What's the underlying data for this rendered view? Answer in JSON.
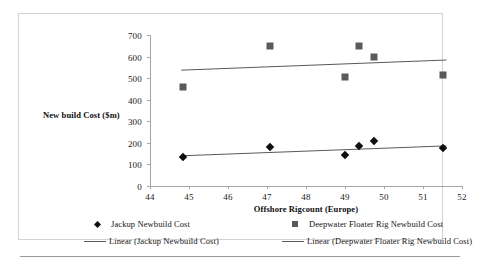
{
  "chart_data": {
    "type": "scatter",
    "title": "",
    "xlabel": "Offshore Rigcount (Europe)",
    "ylabel": "New build Cost ($m)",
    "xlim": [
      44,
      52
    ],
    "ylim": [
      0,
      700
    ],
    "xticks": [
      44,
      45,
      46,
      47,
      48,
      49,
      50,
      51,
      52
    ],
    "yticks": [
      0,
      100,
      200,
      300,
      400,
      500,
      600,
      700
    ],
    "grid": false,
    "legend_position": "bottom",
    "series": [
      {
        "name": "Jackup Newbuild Cost",
        "marker": "diamond",
        "color": "#0f0f0f",
        "points": [
          {
            "x": 44.85,
            "y": 133
          },
          {
            "x": 47.08,
            "y": 183
          },
          {
            "x": 49.0,
            "y": 143
          },
          {
            "x": 49.35,
            "y": 186
          },
          {
            "x": 49.75,
            "y": 207
          },
          {
            "x": 51.5,
            "y": 174
          }
        ]
      },
      {
        "name": "Deepwater Floater Rig Newbuild Cost",
        "marker": "square",
        "color": "#5a5a5a",
        "points": [
          {
            "x": 44.85,
            "y": 458
          },
          {
            "x": 47.08,
            "y": 648
          },
          {
            "x": 49.0,
            "y": 506
          },
          {
            "x": 49.35,
            "y": 647
          },
          {
            "x": 49.75,
            "y": 598
          },
          {
            "x": 51.5,
            "y": 514
          }
        ]
      }
    ],
    "trendlines": [
      {
        "name": "Linear (Jackup Newbuild Cost)",
        "color": "#595959",
        "x0": 44.8,
        "y0": 140,
        "x1": 51.6,
        "y1": 186
      },
      {
        "name": "Linear (Deepwater Floater Rig Newbuild Cost)",
        "color": "#595959",
        "x0": 44.8,
        "y0": 537,
        "x1": 51.6,
        "y1": 584
      }
    ]
  },
  "axis": {
    "y_title": "New build Cost ($m)",
    "x_title": "Offshore Rigcount (Europe)",
    "y_tick_labels": [
      "700",
      "600",
      "500",
      "400",
      "300",
      "200",
      "100",
      "0"
    ],
    "x_tick_labels": [
      "44",
      "45",
      "46",
      "47",
      "48",
      "49",
      "50",
      "51",
      "52"
    ]
  },
  "legend": {
    "entries": [
      {
        "label": "Jackup Newbuild Cost",
        "key": "diamond-marker"
      },
      {
        "label": "Deepwater Floater Rig Newbuild Cost",
        "key": "square-marker"
      },
      {
        "label": "Linear (Jackup Newbuild Cost)",
        "key": "line-key"
      },
      {
        "label": "Linear (Deepwater Floater Rig Newbuild Cost)",
        "key": "line-key"
      }
    ]
  },
  "colors": {
    "jackup": "#0f0f0f",
    "deepwater": "#5a5a5a",
    "trend": "#595959",
    "axis": "#a6a6a6",
    "border": "#d2d2d2"
  }
}
